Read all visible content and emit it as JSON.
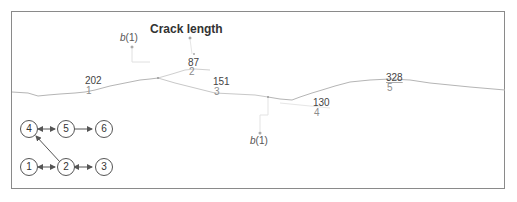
{
  "title": "Crack length",
  "branch_markers": [
    {
      "label_italic": "b",
      "label_rest": "(1)",
      "position": "upper-left"
    },
    {
      "label_italic": "b",
      "label_rest": "(1)",
      "position": "lower-middle"
    }
  ],
  "segments": [
    {
      "id": "1",
      "length": "202"
    },
    {
      "id": "2",
      "length": "87"
    },
    {
      "id": "3",
      "length": "151"
    },
    {
      "id": "4",
      "length": "130"
    },
    {
      "id": "5",
      "length": "328"
    }
  ],
  "graph": {
    "nodes": [
      "1",
      "2",
      "3",
      "4",
      "5",
      "6"
    ],
    "edges": [
      {
        "from": "4",
        "to": "5",
        "type": "bidirectional"
      },
      {
        "from": "5",
        "to": "6",
        "type": "directed"
      },
      {
        "from": "2",
        "to": "4",
        "type": "directed"
      },
      {
        "from": "1",
        "to": "2",
        "type": "bidirectional"
      },
      {
        "from": "2",
        "to": "3",
        "type": "bidirectional"
      }
    ]
  },
  "colors": {
    "crack_line": "#b5b5b5",
    "frame": "#8a8a8a",
    "text_dark": "#333333",
    "text_light": "#8c8c8c"
  }
}
